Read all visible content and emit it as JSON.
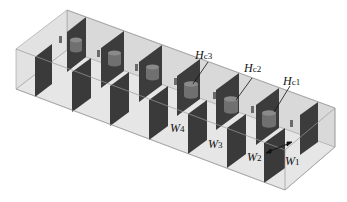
{
  "figure": {
    "colors": {
      "box_fill": "#dcdcdc",
      "box_edge": "#9a9a9a",
      "wall_fill": "#3e3e3e",
      "wall_side": "#5a5a5a",
      "cylinder": "#6e6e6e",
      "marker": "#777777",
      "label": "#111111"
    }
  },
  "labels": {
    "hc1": {
      "main": "H",
      "sub": "c1"
    },
    "hc2": {
      "main": "H",
      "sub": "c2"
    },
    "hc3": {
      "main": "H",
      "sub": "c3"
    },
    "w1": {
      "main": "W",
      "sub": "1"
    },
    "w2": {
      "main": "W",
      "sub": "2"
    },
    "w3": {
      "main": "W",
      "sub": "3"
    },
    "w4": {
      "main": "W",
      "sub": "4"
    }
  }
}
